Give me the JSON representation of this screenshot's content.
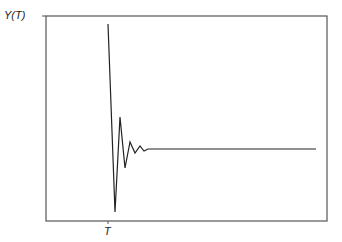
{
  "chart_data": {
    "type": "line",
    "title": "",
    "xlabel": "",
    "ylabel": "Y(T)",
    "x_tick_labels": [
      "T"
    ],
    "grid": false,
    "legend": null,
    "series": [
      {
        "name": "Y(T)",
        "points_px": [
          [
            108,
            24
          ],
          [
            115,
            212
          ],
          [
            120,
            117
          ],
          [
            125,
            168
          ],
          [
            130,
            142
          ],
          [
            135,
            153
          ],
          [
            140,
            146
          ],
          [
            144,
            151
          ],
          [
            148,
            149
          ],
          [
            316,
            149
          ]
        ]
      }
    ],
    "colors": {
      "line": "#222222",
      "frame": "#555555"
    }
  },
  "labels": {
    "y_axis": "Y(T)",
    "x_tick": "T"
  }
}
